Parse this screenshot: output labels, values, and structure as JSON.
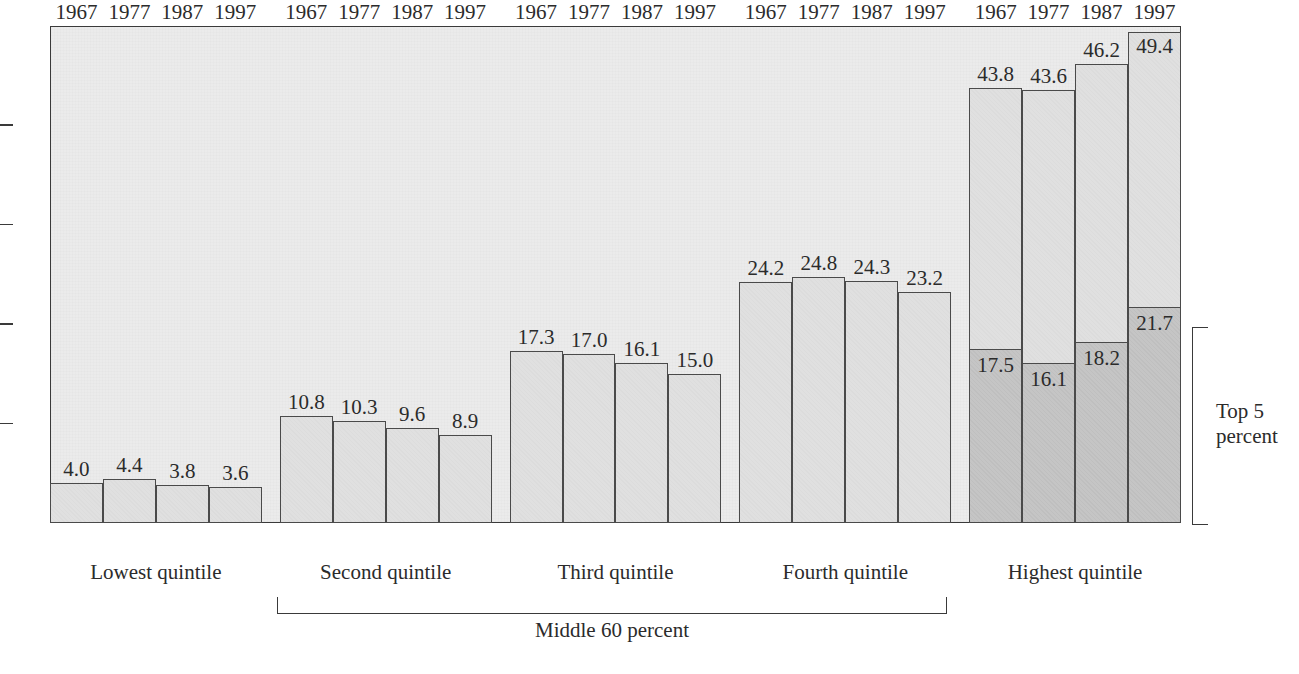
{
  "chart_data": {
    "type": "bar",
    "title": "",
    "subtitle": "",
    "xlabel": "",
    "ylabel": "",
    "ylim": [
      0,
      50
    ],
    "ytick_labels": [
      "50",
      "40",
      "30",
      "20",
      "10",
      "0"
    ],
    "ytick_values": [
      50,
      40,
      30,
      20,
      10,
      0
    ],
    "grid": false,
    "legend_position": "none",
    "categories": [
      "1967",
      "1977",
      "1987",
      "1997"
    ],
    "groups": [
      {
        "caption": "Lowest quintile",
        "values": [
          4.0,
          4.4,
          3.8,
          3.6
        ],
        "labels": [
          "4.0",
          "4.4",
          "3.8",
          "3.6"
        ],
        "has_top5": false
      },
      {
        "caption": "Second quintile",
        "values": [
          10.8,
          10.3,
          9.6,
          8.9
        ],
        "labels": [
          "10.8",
          "10.3",
          "9.6",
          "8.9"
        ],
        "has_top5": false
      },
      {
        "caption": "Third quintile",
        "values": [
          17.3,
          17.0,
          16.1,
          15.0
        ],
        "labels": [
          "17.3",
          "17.0",
          "16.1",
          "15.0"
        ],
        "has_top5": false
      },
      {
        "caption": "Fourth quintile",
        "values": [
          24.2,
          24.8,
          24.3,
          23.2
        ],
        "labels": [
          "24.2",
          "24.8",
          "24.3",
          "23.2"
        ],
        "has_top5": false
      },
      {
        "caption": "Highest quintile",
        "values": [
          43.8,
          43.6,
          46.2,
          49.4
        ],
        "labels": [
          "43.8",
          "43.6",
          "46.2",
          "49.4"
        ],
        "has_top5": true,
        "top5_values": [
          17.5,
          16.1,
          18.2,
          21.7
        ],
        "top5_labels": [
          "17.5",
          "16.1",
          "18.2",
          "21.7"
        ]
      }
    ],
    "annotations": [
      {
        "name": "middle-60-bracket",
        "text": "Middle 60 percent",
        "spans": [
          "Second quintile",
          "Third quintile",
          "Fourth quintile"
        ]
      },
      {
        "name": "top-5-bracket",
        "text": "Top 5\npercent",
        "line1": "Top 5",
        "line2": "percent",
        "applies_to": "Highest quintile"
      }
    ]
  },
  "colors": {
    "bar_fill": "#e0e0e0",
    "bar_top5_fill": "#c5c5c5",
    "bar_stroke": "#4a4a4a",
    "plot_background": "#ebebeb",
    "axis": "#3a3a3a",
    "text": "#2b2b2b",
    "page_background": "#ffffff"
  },
  "axis": {
    "y_ticks": [
      {
        "label": "50",
        "value": 50
      },
      {
        "label": "40",
        "value": 40
      },
      {
        "label": "30",
        "value": 30
      },
      {
        "label": "20",
        "value": 20
      },
      {
        "label": "10",
        "value": 10
      },
      {
        "label": "0",
        "value": 0
      }
    ]
  },
  "brackets": {
    "middle": {
      "label": "Middle 60 percent"
    },
    "top5": {
      "line1": "Top 5",
      "line2": "percent"
    }
  }
}
